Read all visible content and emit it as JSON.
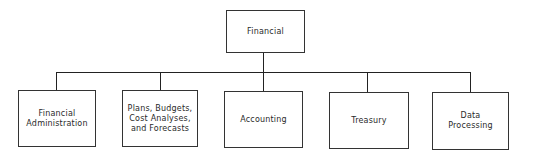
{
  "diagram": {
    "type": "org-chart",
    "root": {
      "label": "Financial"
    },
    "children": [
      {
        "label": "Financial\nAdministration"
      },
      {
        "label": "Plans, Budgets,\nCost Analyses,\nand  Forecasts"
      },
      {
        "label": "Accounting"
      },
      {
        "label": "Treasury"
      },
      {
        "label": "Data\nProcessing"
      }
    ],
    "colors": {
      "line": "#222222",
      "border": "#333333",
      "text": "#2a2a2a",
      "background": "#ffffff"
    }
  }
}
